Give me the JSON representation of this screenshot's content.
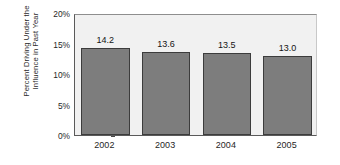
{
  "chart_data": {
    "type": "bar",
    "title": "",
    "subtitle": "",
    "xlabel": "",
    "ylabel": "Percent Driving Under the Influence in Past Year",
    "ylabel_lines": [
      "Percent Driving Under the",
      "Influence in Past Year"
    ],
    "categories": [
      "2002",
      "2003",
      "2004",
      "2005"
    ],
    "values": [
      14.2,
      13.6,
      13.5,
      13.0
    ],
    "value_labels": [
      "14.2",
      "13.6",
      "13.5",
      "13.0"
    ],
    "ylim": [
      0,
      20
    ],
    "y_ticks": [
      0,
      5,
      10,
      15,
      20
    ],
    "y_tick_labels": [
      "0%",
      "5%",
      "10%",
      "15%",
      "20%"
    ],
    "grid": false,
    "legend": null,
    "legend_position": "none",
    "colors": {
      "bar_fill": "#7d7d7d",
      "bar_border": "#3c3c3c",
      "plot_background": "#f1f1f1",
      "axis_line": "#5a5a5a",
      "text": "#1f1f1f",
      "figure_background": "#ffffff"
    }
  }
}
